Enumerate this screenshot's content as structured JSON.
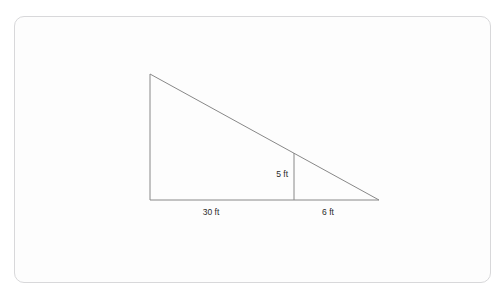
{
  "page": {
    "clipped_heading": "",
    "background_color": "#ffffff"
  },
  "figure_card": {
    "border_color": "#d8d8da",
    "background_color": "#fdfdfd",
    "line_color": "#888888",
    "text_color": "#2b2b2b"
  },
  "figure": {
    "shape": "right-triangle-with-internal-height",
    "labels": {
      "height_small": "5 ft",
      "base_left": "30 ft",
      "base_right": "6 ft"
    },
    "measurements": {
      "small_height_value": 5,
      "small_height_unit": "ft",
      "left_base_value": 30,
      "left_base_unit": "ft",
      "right_base_value": 6,
      "right_base_unit": "ft"
    },
    "geometry": {
      "apex": [
        135,
        57
      ],
      "bottom_left": [
        135,
        183
      ],
      "bottom_right": [
        364,
        183
      ],
      "inner_vertical_x": 279,
      "inner_vertical_top_y": 136,
      "inner_vertical_bottom_y": 183
    }
  }
}
